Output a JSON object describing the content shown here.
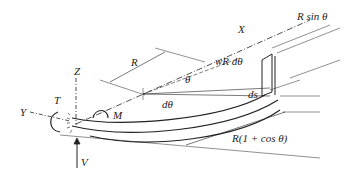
{
  "diagram": {
    "axes": {
      "x": "X",
      "y": "Y",
      "z": "Z"
    },
    "loads": {
      "torque": "T",
      "moment": "M",
      "shear": "V",
      "distributed": "wR dθ"
    },
    "dimensions": {
      "radius": "R",
      "angle": "θ",
      "dangle": "dθ",
      "ds": "ds",
      "r_sin": "R sin θ",
      "r_one_plus_cos": "R(1 + cos θ)"
    }
  }
}
